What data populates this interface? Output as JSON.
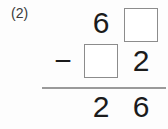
{
  "problem": {
    "label": "(2)",
    "operation": "subtraction",
    "minuend_row": {
      "tens": "6",
      "ones": "",
      "ones_is_blank": true
    },
    "subtrahend_row": {
      "operator": "−",
      "tens": "",
      "tens_is_blank": true,
      "ones": "2"
    },
    "answer_row": {
      "tens": "2",
      "ones": "6"
    }
  },
  "colors": {
    "background": "#fdfdfd",
    "digit": "#1b1b1b",
    "label": "#3a3a3a",
    "box_border": "#8c8c8c",
    "rule": "#9a9a9a"
  }
}
